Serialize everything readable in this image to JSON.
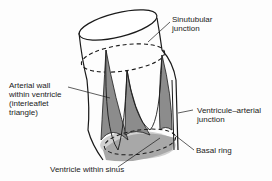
{
  "diagram": {
    "labels": {
      "sinutubular_1": "Sinutubular",
      "sinutubular_2": "junction",
      "arterial_1": "Arterial wall",
      "arterial_2": "within ventricle",
      "arterial_3": "(interleaflet",
      "arterial_4": "triangle)",
      "va_1": "Ventricule–arterial",
      "va_2": "junction",
      "basal": "Basal ring",
      "vws": "Ventricle within sinus"
    },
    "colors": {
      "stroke": "#1a1a1a",
      "triangle_fill": "#8c8c8c",
      "ventricle_fill": "#a8a8a8",
      "ring_fill": "#d0d0d0"
    }
  }
}
